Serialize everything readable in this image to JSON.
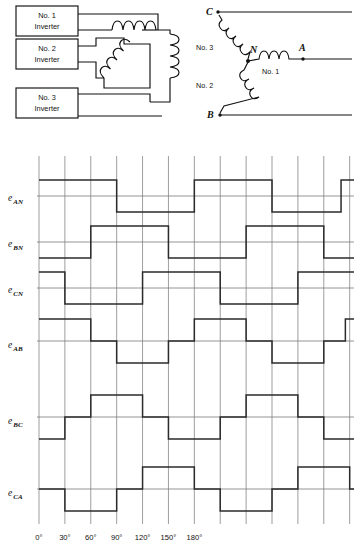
{
  "figure": {
    "title": "",
    "inverter_circuit": {
      "boxes": [
        {
          "label_line1": "No. 1",
          "label_line2": "Inverter"
        },
        {
          "label_line1": "No. 2",
          "label_line2": "Inverter"
        },
        {
          "label_line1": "No. 3",
          "label_line2": "Inverter"
        }
      ],
      "coil_count": 3
    },
    "wye_circuit": {
      "nodes": [
        {
          "name": "C"
        },
        {
          "name": "B"
        },
        {
          "name": "N"
        },
        {
          "name": "A"
        }
      ],
      "winding_labels": [
        {
          "label": "No. 3"
        },
        {
          "label": "No. 2"
        },
        {
          "label": "No. 1"
        }
      ]
    },
    "waveform_labels": [
      {
        "base": "e",
        "sub": "AN"
      },
      {
        "base": "e",
        "sub": "BN"
      },
      {
        "base": "e",
        "sub": "CN"
      },
      {
        "base": "e",
        "sub": "AB"
      },
      {
        "base": "e",
        "sub": "BC"
      },
      {
        "base": "e",
        "sub": "CA"
      }
    ],
    "x_tick_labels": [
      "0°",
      "30°",
      "60°",
      "90°",
      "120°",
      "150°",
      "180°"
    ],
    "colors": {
      "trace": "#2b2b2b",
      "grid": "#8c8c8c",
      "wire": "#111111",
      "background": "#ffffff"
    }
  },
  "chart_data": {
    "type": "line",
    "title": "",
    "xlabel": "",
    "ylabel": "",
    "grid": true,
    "legend_position": "left-labels",
    "x_unit": "degrees",
    "x_tick_values": [
      0,
      30,
      60,
      90,
      120,
      150,
      180,
      210,
      240,
      270,
      300,
      330,
      360
    ],
    "x_tick_labels": [
      "0°",
      "30°",
      "60°",
      "90°",
      "120°",
      "150°",
      "180°",
      "",
      "",
      "",
      "",
      "",
      ""
    ],
    "xlim": [
      0,
      365
    ],
    "note": "Phase voltages are two-level square waves (180 deg conduction); line voltages are three-level staircase waves (120 deg steps).",
    "series": [
      {
        "name": "e_AN",
        "kind": "phase",
        "levels": [
          1,
          -1
        ],
        "ylim": [
          -1,
          1
        ],
        "steps": [
          {
            "from": 0,
            "to": 90,
            "value": 1
          },
          {
            "from": 90,
            "to": 180,
            "value": -1
          },
          {
            "from": 180,
            "to": 270,
            "value": 1
          },
          {
            "from": 270,
            "to": 350,
            "value": -1
          },
          {
            "from": 350,
            "to": 365,
            "value": 1
          }
        ]
      },
      {
        "name": "e_BN",
        "kind": "phase",
        "levels": [
          1,
          -1
        ],
        "ylim": [
          -1,
          1
        ],
        "steps": [
          {
            "from": 0,
            "to": 60,
            "value": -1
          },
          {
            "from": 60,
            "to": 150,
            "value": 1
          },
          {
            "from": 150,
            "to": 240,
            "value": -1
          },
          {
            "from": 240,
            "to": 330,
            "value": 1
          },
          {
            "from": 330,
            "to": 365,
            "value": -1
          }
        ]
      },
      {
        "name": "e_CN",
        "kind": "phase",
        "levels": [
          1,
          -1
        ],
        "ylim": [
          -1,
          1
        ],
        "steps": [
          {
            "from": 0,
            "to": 30,
            "value": 1
          },
          {
            "from": 30,
            "to": 120,
            "value": -1
          },
          {
            "from": 120,
            "to": 210,
            "value": 1
          },
          {
            "from": 210,
            "to": 300,
            "value": -1
          },
          {
            "from": 300,
            "to": 365,
            "value": 1
          }
        ]
      },
      {
        "name": "e_AB",
        "kind": "line",
        "levels": [
          1,
          0,
          -1
        ],
        "ylim": [
          -1,
          1
        ],
        "steps": [
          {
            "from": 0,
            "to": 60,
            "value": 1
          },
          {
            "from": 60,
            "to": 90,
            "value": 0
          },
          {
            "from": 90,
            "to": 150,
            "value": -1
          },
          {
            "from": 150,
            "to": 180,
            "value": 0
          },
          {
            "from": 180,
            "to": 240,
            "value": 1
          },
          {
            "from": 240,
            "to": 270,
            "value": 0
          },
          {
            "from": 270,
            "to": 330,
            "value": -1
          },
          {
            "from": 330,
            "to": 355,
            "value": 0
          },
          {
            "from": 355,
            "to": 365,
            "value": 1
          }
        ]
      },
      {
        "name": "e_BC",
        "kind": "line",
        "levels": [
          1,
          0,
          -1
        ],
        "ylim": [
          -1,
          1
        ],
        "steps": [
          {
            "from": 0,
            "to": 30,
            "value": -1
          },
          {
            "from": 30,
            "to": 60,
            "value": 0
          },
          {
            "from": 60,
            "to": 120,
            "value": 1
          },
          {
            "from": 120,
            "to": 150,
            "value": 0
          },
          {
            "from": 150,
            "to": 210,
            "value": -1
          },
          {
            "from": 210,
            "to": 240,
            "value": 0
          },
          {
            "from": 240,
            "to": 300,
            "value": 1
          },
          {
            "from": 300,
            "to": 330,
            "value": 0
          },
          {
            "from": 330,
            "to": 365,
            "value": -1
          }
        ]
      },
      {
        "name": "e_CA",
        "kind": "line",
        "levels": [
          1,
          0,
          -1
        ],
        "ylim": [
          -1,
          1
        ],
        "steps": [
          {
            "from": 0,
            "to": 30,
            "value": 0
          },
          {
            "from": 30,
            "to": 90,
            "value": -1
          },
          {
            "from": 90,
            "to": 120,
            "value": 0
          },
          {
            "from": 120,
            "to": 180,
            "value": 1
          },
          {
            "from": 180,
            "to": 210,
            "value": 0
          },
          {
            "from": 210,
            "to": 270,
            "value": -1
          },
          {
            "from": 270,
            "to": 300,
            "value": 0
          },
          {
            "from": 300,
            "to": 360,
            "value": 1
          },
          {
            "from": 360,
            "to": 365,
            "value": 0
          }
        ]
      }
    ]
  }
}
